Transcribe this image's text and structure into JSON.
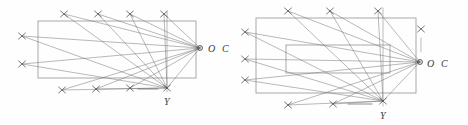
{
  "figure": {
    "background_color": "#fefefe",
    "line_color": "#6b6b6b",
    "rect_color": "#8a8a8a",
    "marker_color": "#555555",
    "label_color": "#3a3a3a",
    "width": 468,
    "height": 125
  },
  "diagrams": [
    {
      "id": "left-diagram",
      "name": "single-rectangle-diagram",
      "rectangles": [
        {
          "name": "outer-rectangle",
          "x": 38,
          "y": 21,
          "w": 158,
          "h": 57
        }
      ],
      "convergence_points": [
        {
          "name": "point-o",
          "label": "O",
          "x": 200,
          "y": 48,
          "label_x": 208,
          "label_y": 51
        },
        {
          "name": "point-y",
          "label": "Y",
          "x": 167,
          "y": 88,
          "label_x": 164,
          "label_y": 104
        }
      ],
      "labels": [
        {
          "name": "label-c",
          "text": "C",
          "x": 222,
          "y": 51
        },
        {
          "name": "label-o",
          "text": "O",
          "x": 208,
          "y": 51
        },
        {
          "name": "label-y",
          "text": "Y",
          "x": 164,
          "y": 104
        }
      ],
      "markers": [
        {
          "name": "marker-top-1",
          "x": 64,
          "y": 14
        },
        {
          "name": "marker-top-2",
          "x": 98,
          "y": 14
        },
        {
          "name": "marker-top-3",
          "x": 130,
          "y": 14
        },
        {
          "name": "marker-top-4",
          "x": 164,
          "y": 14
        },
        {
          "name": "marker-left-1",
          "x": 22,
          "y": 36
        },
        {
          "name": "marker-left-2",
          "x": 22,
          "y": 64
        },
        {
          "name": "marker-bottom-1",
          "x": 62,
          "y": 90
        },
        {
          "name": "marker-bottom-2",
          "x": 96,
          "y": 89
        },
        {
          "name": "marker-bottom-3",
          "x": 130,
          "y": 88
        },
        {
          "name": "marker-bottom-4",
          "x": 167,
          "y": 88
        }
      ],
      "vertical_guide": {
        "name": "vertical-guide-line",
        "x": 167,
        "y1": 12,
        "y2": 92
      },
      "dash": {
        "name": "short-dash-segment",
        "x1": 138,
        "y1": 89,
        "x2": 158,
        "y2": 89
      }
    },
    {
      "id": "right-diagram",
      "name": "nested-rectangle-diagram",
      "rectangles": [
        {
          "name": "outer-rectangle",
          "x": 256,
          "y": 18,
          "w": 160,
          "h": 75
        },
        {
          "name": "inner-rectangle",
          "x": 286,
          "y": 45,
          "w": 104,
          "h": 28
        }
      ],
      "convergence_points": [
        {
          "name": "point-o",
          "label": "O",
          "x": 420,
          "y": 62,
          "label_x": 427,
          "label_y": 66
        },
        {
          "name": "point-y",
          "label": "Y",
          "x": 383,
          "y": 101,
          "label_x": 380,
          "label_y": 118
        }
      ],
      "labels": [
        {
          "name": "label-c",
          "text": "C",
          "x": 441,
          "y": 66
        },
        {
          "name": "label-o",
          "text": "O",
          "x": 427,
          "y": 66
        },
        {
          "name": "label-y",
          "text": "Y",
          "x": 380,
          "y": 118
        }
      ],
      "markers": [
        {
          "name": "marker-top-1",
          "x": 288,
          "y": 11
        },
        {
          "name": "marker-top-2",
          "x": 330,
          "y": 11
        },
        {
          "name": "marker-top-3",
          "x": 378,
          "y": 11
        },
        {
          "name": "marker-left-1",
          "x": 245,
          "y": 32
        },
        {
          "name": "marker-left-2",
          "x": 245,
          "y": 59
        },
        {
          "name": "marker-left-3",
          "x": 245,
          "y": 80
        },
        {
          "name": "marker-bottom-1",
          "x": 288,
          "y": 105
        },
        {
          "name": "marker-bottom-2",
          "x": 333,
          "y": 104
        },
        {
          "name": "marker-bottom-3",
          "x": 383,
          "y": 101
        },
        {
          "name": "marker-above-o",
          "x": 421,
          "y": 29
        }
      ],
      "vertical_guide": {
        "name": "vertical-guide-line",
        "x": 383,
        "y1": 8,
        "y2": 106
      },
      "guide_tick": {
        "name": "o-guide-tick",
        "x": 421,
        "y1": 38,
        "y2": 52
      },
      "dash": {
        "name": "short-dash-segment",
        "x1": 348,
        "y1": 104,
        "x2": 372,
        "y2": 104
      }
    }
  ]
}
